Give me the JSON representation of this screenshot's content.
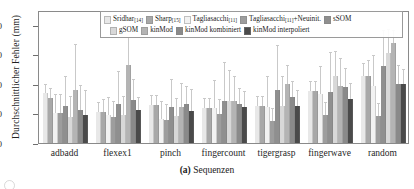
{
  "axis": {
    "ylabel": "Durchschnittlicher Fehler (mm)",
    "yticks": [
      "0",
      "10",
      "20",
      "30",
      "40"
    ],
    "xlabel": ""
  },
  "caption": {
    "tag": "(a)",
    "text": " Sequenzen"
  },
  "legend": {
    "row1": [
      {
        "label": "Sridhar",
        "cite": "[14]",
        "color": "#e8e8e8"
      },
      {
        "label": "Sharp",
        "cite": "[15]",
        "color": "#a8a8a8"
      },
      {
        "label": "Tagliasacchi",
        "cite": "[11]",
        "color": "#f2f2f2"
      },
      {
        "label": "Tagliasacchi",
        "cite": "[11]",
        "suffix": "+Neuinit.",
        "color": "#9d9d9d"
      },
      {
        "label": "sSOM",
        "cite": "",
        "color": "#8f8f8f"
      }
    ],
    "row2": [
      {
        "label": "gSOM",
        "cite": "",
        "color": "#d8d8d8"
      },
      {
        "label": "kinMod",
        "cite": "",
        "color": "#b4b4b4"
      },
      {
        "label": "kinMod kombiniert",
        "cite": "",
        "color": "#8a8a8a"
      },
      {
        "label": "kinMod interpoliert",
        "cite": "",
        "color": "#4a4a4a"
      }
    ]
  },
  "chart_data": {
    "type": "bar",
    "title": "",
    "subtitle": "",
    "xlabel": "",
    "ylabel": "Durchschnittlicher Fehler (mm)",
    "ylim": [
      0,
      45
    ],
    "yticks": [
      0,
      10,
      20,
      30,
      40
    ],
    "grid": false,
    "legend_position": "top-center",
    "categories": [
      "adbadd",
      "flexex1",
      "pinch",
      "fingercount",
      "tigergrasp",
      "fingerwave",
      "random"
    ],
    "series": [
      {
        "name": "Sridhar [14]",
        "color": "#e8e8e8",
        "values": [
          17.0,
          10.5,
          12.8,
          12.0,
          12.5,
          17.7,
          22.7
        ],
        "errors": [
          2.5,
          3.0,
          3.0,
          3.0,
          3.0,
          3.0,
          4.0
        ]
      },
      {
        "name": "Sharp [15]",
        "color": "#a8a8a8",
        "values": [
          15.2,
          10.6,
          12.8,
          12.0,
          12.5,
          17.7,
          22.7
        ],
        "errors": [
          3.0,
          4.0,
          3.0,
          3.0,
          3.0,
          3.0,
          5.0
        ]
      },
      {
        "name": "Tagliasacchi [11]",
        "color": "#f2f2f2",
        "values": [
          10.1,
          9.4,
          8.0,
          12.0,
          12.2,
          16.7,
          19.3
        ],
        "errors": [
          6.0,
          6.0,
          6.0,
          9.0,
          10.0,
          9.0,
          10.0
        ]
      },
      {
        "name": "Tagliasacchi [11]+Neuinit.",
        "color": "#9d9d9d",
        "values": [
          10.2,
          8.8,
          7.8,
          9.7,
          7.5,
          9.5,
          9.3
        ],
        "errors": [
          6.0,
          5.0,
          5.0,
          5.0,
          4.0,
          4.0,
          4.0
        ]
      },
      {
        "name": "sSOM",
        "color": "#8f8f8f",
        "values": [
          12.4,
          13.1,
          12.2,
          14.2,
          17.9,
          17.3,
          25.9
        ],
        "errors": [
          10.0,
          11.0,
          9.0,
          13.0,
          15.0,
          13.0,
          12.0
        ]
      },
      {
        "name": "gSOM",
        "color": "#d8d8d8",
        "values": [
          8.7,
          9.5,
          9.0,
          14.3,
          12.4,
          22.8,
          30.4
        ],
        "errors": [
          7.0,
          6.0,
          6.0,
          10.0,
          10.0,
          8.0,
          8.0
        ]
      },
      {
        "name": "kinMod",
        "color": "#b4b4b4",
        "values": [
          18.0,
          26.4,
          12.1,
          14.2,
          19.9,
          19.4,
          33.9
        ],
        "errors": [
          15.0,
          9.0,
          8.0,
          8.0,
          6.0,
          9.0,
          4.0
        ]
      },
      {
        "name": "kinMod kombiniert",
        "color": "#8a8a8a",
        "values": [
          11.3,
          14.4,
          13.1,
          13.2,
          15.5,
          18.9,
          19.9
        ],
        "errors": [
          8.0,
          7.0,
          6.0,
          5.0,
          5.0,
          6.0,
          6.0
        ]
      },
      {
        "name": "kinMod interpoliert",
        "color": "#4a4a4a",
        "values": [
          9.6,
          11.2,
          10.9,
          12.1,
          12.6,
          14.9,
          19.8
        ],
        "errors": [
          8.0,
          4.0,
          7.0,
          5.0,
          5.0,
          5.0,
          5.0
        ]
      }
    ]
  }
}
